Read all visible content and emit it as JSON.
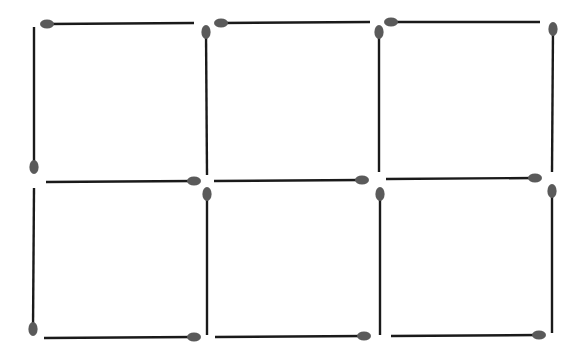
{
  "puzzle": {
    "title": "",
    "description": "Matchstick puzzle: 17 matchsticks forming a 3x2 grid of six squares",
    "grid": {
      "columns": 3,
      "rows": 2
    },
    "colors": {
      "stick": "#1a1a1a",
      "head": "#5a5a5a",
      "background": "#ffffff"
    },
    "matchsticks": [
      {
        "id": "h-top-1",
        "orientation": "horizontal",
        "x1": 47,
        "y1": 24,
        "x2": 194,
        "y2": 23,
        "head": "start"
      },
      {
        "id": "h-top-2",
        "orientation": "horizontal",
        "x1": 221,
        "y1": 23,
        "x2": 370,
        "y2": 22,
        "head": "start"
      },
      {
        "id": "h-top-3",
        "orientation": "horizontal",
        "x1": 391,
        "y1": 22,
        "x2": 540,
        "y2": 22,
        "head": "start"
      },
      {
        "id": "v-upper-0",
        "orientation": "vertical",
        "x1": 34,
        "y1": 27,
        "x2": 34,
        "y2": 167,
        "head": "end"
      },
      {
        "id": "v-upper-1",
        "orientation": "vertical",
        "x1": 206,
        "y1": 32,
        "x2": 207,
        "y2": 175,
        "head": "start"
      },
      {
        "id": "v-upper-2",
        "orientation": "vertical",
        "x1": 379,
        "y1": 32,
        "x2": 379,
        "y2": 172,
        "head": "start"
      },
      {
        "id": "v-upper-3",
        "orientation": "vertical",
        "x1": 553,
        "y1": 29,
        "x2": 552,
        "y2": 172,
        "head": "start"
      },
      {
        "id": "h-mid-1",
        "orientation": "horizontal",
        "x1": 46,
        "y1": 182,
        "x2": 194,
        "y2": 181,
        "head": "end"
      },
      {
        "id": "h-mid-2",
        "orientation": "horizontal",
        "x1": 214,
        "y1": 181,
        "x2": 362,
        "y2": 180,
        "head": "end"
      },
      {
        "id": "h-mid-3",
        "orientation": "horizontal",
        "x1": 386,
        "y1": 179,
        "x2": 535,
        "y2": 178,
        "head": "end"
      },
      {
        "id": "v-lower-0",
        "orientation": "vertical",
        "x1": 34,
        "y1": 188,
        "x2": 33,
        "y2": 329,
        "head": "end"
      },
      {
        "id": "v-lower-1",
        "orientation": "vertical",
        "x1": 207,
        "y1": 194,
        "x2": 207,
        "y2": 335,
        "head": "start"
      },
      {
        "id": "v-lower-2",
        "orientation": "vertical",
        "x1": 380,
        "y1": 194,
        "x2": 380,
        "y2": 335,
        "head": "start"
      },
      {
        "id": "v-lower-3",
        "orientation": "vertical",
        "x1": 552,
        "y1": 191,
        "x2": 552,
        "y2": 333,
        "head": "start"
      },
      {
        "id": "h-bot-1",
        "orientation": "horizontal",
        "x1": 44,
        "y1": 338,
        "x2": 194,
        "y2": 337,
        "head": "end"
      },
      {
        "id": "h-bot-2",
        "orientation": "horizontal",
        "x1": 215,
        "y1": 337,
        "x2": 364,
        "y2": 336,
        "head": "end"
      },
      {
        "id": "h-bot-3",
        "orientation": "horizontal",
        "x1": 391,
        "y1": 336,
        "x2": 539,
        "y2": 335,
        "head": "end"
      }
    ]
  }
}
